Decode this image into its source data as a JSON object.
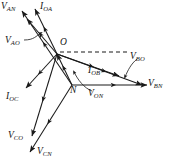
{
  "figure": {
    "type": "phasor-diagram",
    "title": "",
    "background_color": "#ffffff",
    "line_color": "#1a1a1a",
    "origin_point": "O",
    "neutral_point": "N"
  },
  "points": {
    "O": {
      "label": "O",
      "x": 57,
      "y": 54
    },
    "N": {
      "label": "N",
      "x": 72,
      "y": 85
    }
  },
  "point_labels": [
    {
      "id": "point-o",
      "text": "O",
      "x": 60,
      "y": 38
    },
    {
      "id": "point-n",
      "text": "N",
      "x": 70,
      "y": 86
    }
  ],
  "phasors": [
    {
      "id": "v-an",
      "name": "V_AN",
      "base": "V",
      "sub": "AN",
      "from": "N",
      "x1": 72,
      "y1": 85,
      "x2": 22,
      "y2": 11,
      "label_x": 1,
      "label_y": 2
    },
    {
      "id": "v-ao",
      "name": "V_AO",
      "base": "V",
      "sub": "AO",
      "from": "O",
      "x1": 57,
      "y1": 54,
      "x2": 27,
      "y2": 19,
      "label_x": 5,
      "label_y": 36
    },
    {
      "id": "i-oa",
      "name": "I_OA",
      "base": "I",
      "sub": "OA",
      "from": "O",
      "x1": 57,
      "y1": 54,
      "x2": 35,
      "y2": 9,
      "label_x": 40,
      "label_y": 2
    },
    {
      "id": "i-oc",
      "name": "I_OC",
      "base": "I",
      "sub": "OC",
      "from": "O",
      "x1": 57,
      "y1": 54,
      "x2": 26,
      "y2": 88,
      "label_x": 6,
      "label_y": 92
    },
    {
      "id": "v-co",
      "name": "V_CO",
      "base": "V",
      "sub": "CO",
      "from": "O",
      "x1": 57,
      "y1": 54,
      "x2": 32,
      "y2": 136,
      "label_x": 8,
      "label_y": 131
    },
    {
      "id": "v-cn",
      "name": "V_CN",
      "base": "V",
      "sub": "CN",
      "from": "N",
      "x1": 72,
      "y1": 85,
      "x2": 30,
      "y2": 152,
      "label_x": 37,
      "label_y": 147
    },
    {
      "id": "i-ob",
      "name": "I_OB",
      "base": "I",
      "sub": "OB",
      "from": "O",
      "x1": 57,
      "y1": 54,
      "x2": 119,
      "y2": 76,
      "label_x": 88,
      "label_y": 66
    },
    {
      "id": "v-bo",
      "name": "V_BO",
      "base": "V",
      "sub": "BO",
      "from": "O",
      "x1": 57,
      "y1": 54,
      "x2": 142,
      "y2": 85,
      "label_x": 130,
      "label_y": 52
    },
    {
      "id": "v-bn",
      "name": "V_BN",
      "base": "V",
      "sub": "BN",
      "from": "N",
      "x1": 72,
      "y1": 85,
      "x2": 147,
      "y2": 85,
      "label_x": 148,
      "label_y": 79
    },
    {
      "id": "v-on",
      "name": "V_ON",
      "base": "V",
      "sub": "ON",
      "from": "N",
      "x1": 72,
      "y1": 85,
      "x2": 57,
      "y2": 54,
      "label_x": 88,
      "label_y": 89
    }
  ],
  "reference_line": {
    "id": "dashed-reference",
    "description": "horizontal dashed reference from O",
    "x1": 60,
    "y1": 52,
    "x2": 128,
    "y2": 52,
    "dash": "4 3"
  },
  "leaders": [
    {
      "id": "leader-v-ao",
      "path": "M 24 40 C 34 40 36 36 41 33"
    },
    {
      "id": "leader-v-bo",
      "path": "M 137 59 C 131 64 128 70 125 77"
    },
    {
      "id": "leader-v-on",
      "path": "M 92 91 C 84 88 78 80 74 72"
    }
  ]
}
